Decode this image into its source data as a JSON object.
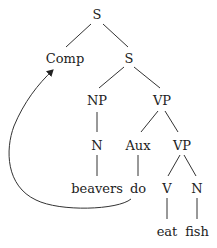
{
  "tree": {
    "nodes": {
      "s_root": "S",
      "comp": "Comp",
      "s_inner": "S",
      "np": "NP",
      "vp_outer": "VP",
      "n_subj": "N",
      "aux": "Aux",
      "vp_inner": "VP",
      "beavers": "beavers",
      "do": "do",
      "v": "V",
      "n_obj": "N",
      "eat": "eat",
      "fish": "fish"
    },
    "movement_arrow": {
      "from": "do",
      "to": "Comp"
    }
  }
}
